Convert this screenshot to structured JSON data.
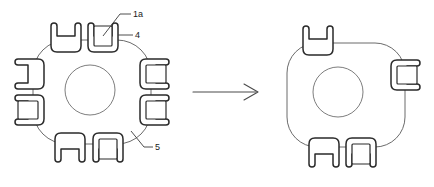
{
  "figure": {
    "background_color": "#ffffff",
    "outline_color": "#5a5a5a",
    "clip_stroke_color": "#2a2a2a",
    "label_color": "#1a1a1a",
    "arrow_color": "#4a4a4a"
  },
  "labels": {
    "callout_1a": "1a",
    "callout_4": "4",
    "callout_5": "5"
  },
  "left_figure": {
    "name": "left-assembly",
    "clip_count": 8,
    "body": {
      "center_x": 92,
      "center_y": 92,
      "width": 118,
      "height": 104,
      "corner_radius": 34
    },
    "hub": {
      "center_x": 90,
      "center_y": 90,
      "radius": 25
    },
    "clips": [
      {
        "id": "top-left-clip",
        "side": "top",
        "cx": 66,
        "cy": 42,
        "has_inner_square": false
      },
      {
        "id": "top-right-clip",
        "side": "top",
        "cx": 103,
        "cy": 42,
        "has_inner_square": true
      },
      {
        "id": "left-upper-clip",
        "side": "left",
        "cx": 28,
        "cy": 72,
        "has_inner_square": false
      },
      {
        "id": "left-lower-clip",
        "side": "left",
        "cx": 28,
        "cy": 108,
        "has_inner_square": true
      },
      {
        "id": "right-upper-clip",
        "side": "right",
        "cx": 155,
        "cy": 72,
        "has_inner_square": true
      },
      {
        "id": "right-lower-clip",
        "side": "right",
        "cx": 155,
        "cy": 108,
        "has_inner_square": true
      },
      {
        "id": "bottom-left-clip",
        "side": "bottom",
        "cx": 70,
        "cy": 143,
        "has_inner_square": false
      },
      {
        "id": "bottom-right-clip",
        "side": "bottom",
        "cx": 108,
        "cy": 143,
        "has_inner_square": true
      }
    ]
  },
  "right_figure": {
    "name": "right-assembly",
    "clip_count": 4,
    "body": {
      "center_x": 345,
      "center_y": 95,
      "width": 118,
      "height": 104,
      "corner_radius": 30
    },
    "hub": {
      "center_x": 338,
      "center_y": 92,
      "radius": 25
    },
    "clips": [
      {
        "id": "top-clip",
        "side": "top",
        "cx": 317,
        "cy": 45,
        "has_inner_square": false
      },
      {
        "id": "right-clip",
        "side": "right",
        "cx": 406,
        "cy": 73,
        "has_inner_square": true
      },
      {
        "id": "bottom-left-clip",
        "side": "bottom",
        "cx": 324,
        "cy": 148,
        "has_inner_square": false
      },
      {
        "id": "bottom-right-clip",
        "side": "bottom",
        "cx": 361,
        "cy": 148,
        "has_inner_square": true
      }
    ]
  },
  "arrow": {
    "name": "transform-arrow",
    "x1": 193,
    "y1": 92,
    "x2": 258,
    "y2": 92,
    "direction": "right"
  }
}
